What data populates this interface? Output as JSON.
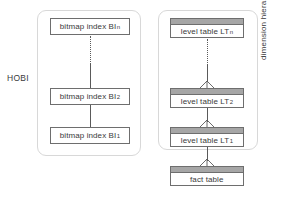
{
  "diagram": {
    "type": "entity-relationship-hierarchy",
    "background_color": "#ffffff",
    "groups": [
      {
        "id": "hobi",
        "label": "HOBI",
        "border_color": "#d8d8d8"
      },
      {
        "id": "dimension",
        "label": "dimension hierarchy",
        "border_color": "#d8d8d8"
      }
    ],
    "labels": {
      "hobi": "HOBI",
      "dimension_hierarchy": "dimension hierarchy"
    },
    "bitmap_indexes": [
      {
        "id": "bi-n",
        "base": "bitmap index BI",
        "subscript": "n"
      },
      {
        "id": "bi-2",
        "base": "bitmap index BI",
        "subscript": "2"
      },
      {
        "id": "bi-1",
        "base": "bitmap index BI",
        "subscript": "1"
      }
    ],
    "level_tables": [
      {
        "id": "lt-n",
        "base": "level table LT",
        "subscript": "n"
      },
      {
        "id": "lt-2",
        "base": "level table LT",
        "subscript": "2"
      },
      {
        "id": "lt-1",
        "base": "level table LT",
        "subscript": "1"
      }
    ],
    "fact_table": {
      "id": "fact",
      "base": "fact table",
      "subscript": ""
    },
    "colors": {
      "box_border": "#6e6e6e",
      "titlebar_fill": "#a6a6a6",
      "group_border": "#d8d8d8",
      "connector": "#5a5a5a",
      "text": "#3a3a3a"
    },
    "connectors": {
      "hobi_ellipsis_style": "dotted",
      "dimension_ellipsis_style": "dotted",
      "relationship_marker": "crows-foot"
    }
  }
}
